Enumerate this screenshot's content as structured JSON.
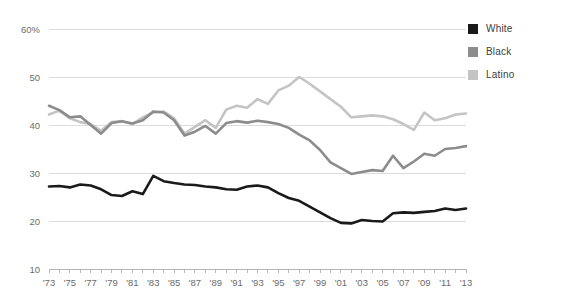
{
  "chart_data": {
    "type": "line",
    "title": "",
    "subtitle": "",
    "xlabel": "",
    "ylabel": "",
    "grid": true,
    "legend_position": "top-right",
    "xlim": [
      1973,
      2013
    ],
    "ylim": [
      10,
      60
    ],
    "ytick_values": [
      10,
      20,
      30,
      40,
      50,
      60
    ],
    "ytick_labels": [
      "10",
      "20",
      "30",
      "40",
      "50",
      "60%"
    ],
    "xtick_labels": [
      "'73",
      "'75",
      "'77",
      "'79",
      "'81",
      "'83",
      "'85",
      "'87",
      "'89",
      "'91",
      "'93",
      "'95",
      "'97",
      "'99",
      "'01",
      "'03",
      "'05",
      "'07",
      "'09",
      "'11",
      "'13"
    ],
    "xtick_values": [
      1973,
      1975,
      1977,
      1979,
      1981,
      1983,
      1985,
      1987,
      1989,
      1991,
      1993,
      1995,
      1997,
      1999,
      2001,
      2003,
      2005,
      2007,
      2009,
      2011,
      2013
    ],
    "x": [
      1973,
      1974,
      1975,
      1976,
      1977,
      1978,
      1979,
      1980,
      1981,
      1982,
      1983,
      1984,
      1985,
      1986,
      1987,
      1988,
      1989,
      1990,
      1991,
      1992,
      1993,
      1994,
      1995,
      1996,
      1997,
      1998,
      1999,
      2000,
      2001,
      2002,
      2003,
      2004,
      2005,
      2006,
      2007,
      2008,
      2009,
      2010,
      2011,
      2012,
      2013
    ],
    "series": [
      {
        "name": "White",
        "color": "#1a1a1a",
        "values": [
          27.2,
          27.3,
          27.0,
          27.6,
          27.4,
          26.6,
          25.4,
          25.2,
          26.2,
          25.6,
          29.4,
          28.3,
          27.9,
          27.6,
          27.5,
          27.2,
          27.0,
          26.6,
          26.5,
          27.2,
          27.4,
          27.0,
          25.8,
          24.8,
          24.2,
          23.0,
          21.8,
          20.6,
          19.6,
          19.5,
          20.2,
          20.0,
          19.9,
          21.6,
          21.8,
          21.7,
          21.9,
          22.1,
          22.6,
          22.3,
          22.6
        ]
      },
      {
        "name": "Black",
        "color": "#8c8c8c",
        "values": [
          44.0,
          43.1,
          41.6,
          41.8,
          40.0,
          38.2,
          40.4,
          40.8,
          40.3,
          41.0,
          42.8,
          42.6,
          41.0,
          37.8,
          38.6,
          39.8,
          38.2,
          40.4,
          40.8,
          40.5,
          40.9,
          40.6,
          40.2,
          39.4,
          38.0,
          36.8,
          34.8,
          32.2,
          31.0,
          29.8,
          30.2,
          30.6,
          30.4,
          33.6,
          31.0,
          32.4,
          34.0,
          33.6,
          35.0,
          35.2,
          35.6
        ]
      },
      {
        "name": "Latino",
        "color": "#c4c4c4",
        "values": [
          42.2,
          43.0,
          41.4,
          40.6,
          40.2,
          38.8,
          40.6,
          40.8,
          40.2,
          41.6,
          42.6,
          42.8,
          41.4,
          38.2,
          39.6,
          41.0,
          39.4,
          43.2,
          44.0,
          43.6,
          45.4,
          44.4,
          47.2,
          48.2,
          50.0,
          48.6,
          47.0,
          45.4,
          43.8,
          41.6,
          41.8,
          42.0,
          41.8,
          41.2,
          40.2,
          39.0,
          42.6,
          41.0,
          41.4,
          42.2,
          42.4
        ]
      }
    ]
  },
  "legend": {
    "items": [
      {
        "label": "White",
        "color": "#1a1a1a"
      },
      {
        "label": "Black",
        "color": "#8c8c8c"
      },
      {
        "label": "Latino",
        "color": "#c4c4c4"
      }
    ]
  }
}
